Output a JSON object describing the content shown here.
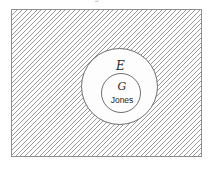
{
  "figure": {
    "type": "euler-venn-diagram",
    "caption": "Figure 1.2",
    "caption_visible": "partially cropped at top edge"
  },
  "universe": {
    "name": "universal-set",
    "fill": "diagonal-hatch",
    "hatch_color": "#9a9a9a",
    "border_color": "#8e8e8e",
    "label": ""
  },
  "sets": {
    "outer": {
      "label": "E",
      "fill": "#fdfdfd",
      "border_color": "#6f6f6f"
    },
    "inner": {
      "label": "G",
      "fill": "#fdfdfd",
      "border_color": "#6f6f6f"
    }
  },
  "elements": [
    {
      "label": "Jones",
      "member_of": "G"
    }
  ],
  "colors": {
    "page_background": "#ffffff",
    "text": "#1f1f1f",
    "caption_text": "#b9b9b9"
  }
}
